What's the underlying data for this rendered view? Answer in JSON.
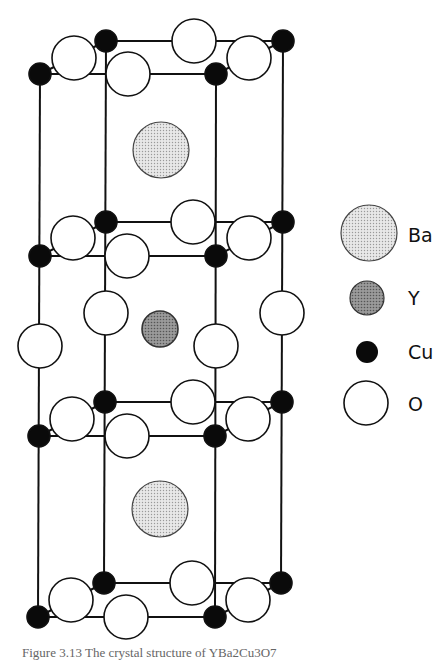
{
  "figure": {
    "caption": "Figure 3.13  The crystal structure of YBa2Cu3O7",
    "colors": {
      "ba_fill": "#dcdcdc",
      "y_fill": "#8a8a8a",
      "cu_fill": "#0a0a0a",
      "o_fill": "#ffffff",
      "stroke": "#111111"
    }
  },
  "legend": {
    "items": [
      {
        "symbol": "ba-atom",
        "label": "Ba"
      },
      {
        "symbol": "y-atom",
        "label": "Y"
      },
      {
        "symbol": "cu-atom",
        "label": "Cu"
      },
      {
        "symbol": "o-atom",
        "label": "O"
      }
    ]
  },
  "structure": {
    "layers": [
      "Cu-O plane (top)",
      "Cu-O plane",
      "Cu-O plane",
      "Cu-O plane (bottom)"
    ],
    "center_atoms": {
      "ba_upper": "Ba",
      "y_middle": "Y",
      "ba_lower": "Ba"
    }
  }
}
